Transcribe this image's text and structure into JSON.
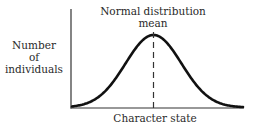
{
  "diagram": {
    "title_line1": "Normal distribution",
    "title_line2": "mean",
    "y_label_line1": "Number",
    "y_label_line2": "of",
    "y_label_line3": "individuals",
    "x_label": "Character state"
  },
  "chart_data": {
    "type": "line",
    "title": "Normal distribution",
    "xlabel": "Character state",
    "ylabel": "Number of individuals",
    "annotations": [
      "mean"
    ],
    "series": [
      {
        "name": "Normal distribution",
        "shape": "gaussian bell curve",
        "x": [
          -3,
          -2.5,
          -2,
          -1.5,
          -1,
          -0.5,
          0,
          0.5,
          1,
          1.5,
          2,
          2.5,
          3
        ],
        "values": [
          0.011,
          0.044,
          0.135,
          0.325,
          0.607,
          0.882,
          1.0,
          0.882,
          0.607,
          0.325,
          0.135,
          0.044,
          0.011
        ]
      }
    ],
    "mean_marker": {
      "x": 0,
      "style": "dashed vertical line"
    },
    "ticks": "none",
    "grid": false,
    "legend": "none"
  },
  "colors": {
    "curve": "#111111",
    "axes": "#222222",
    "text": "#2a2a2a",
    "background": "#ffffff"
  }
}
